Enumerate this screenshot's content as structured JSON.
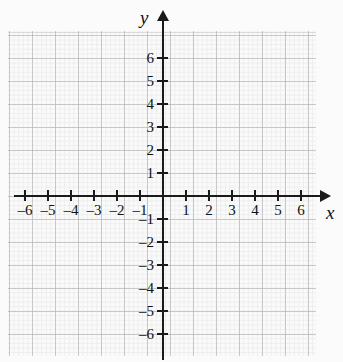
{
  "chart_data": {
    "type": "scatter",
    "title": "",
    "xlabel": "x",
    "ylabel": "y",
    "xlim": [
      -7,
      7
    ],
    "ylim": [
      -7,
      7
    ],
    "grid": true,
    "legend": false,
    "series": [],
    "x_ticks": [
      -6,
      -5,
      -4,
      -3,
      -2,
      -1,
      1,
      2,
      3,
      4,
      5,
      6
    ],
    "y_ticks": [
      6,
      5,
      4,
      3,
      2,
      1,
      -1,
      -2,
      -3,
      -4,
      -5,
      -6
    ],
    "x_tick_labels": [
      "–6",
      "–5",
      "–4",
      "–3",
      "–2",
      "–1",
      "1",
      "2",
      "3",
      "4",
      "5",
      "6"
    ],
    "y_tick_labels": [
      "6",
      "5",
      "4",
      "3",
      "2",
      "1",
      "–1",
      "–2",
      "–3",
      "–4",
      "–5",
      "–6"
    ],
    "origin_label": "",
    "unit_px": 23,
    "colors": {
      "axis": "#1a1a1a",
      "grid_major": "#d8d8d8",
      "grid_minor": "#ececec",
      "background": "#fafafa",
      "text": "#111111"
    }
  },
  "axes": {
    "x_name": "x",
    "y_name": "y"
  },
  "x_labels": [
    {
      "text": "–6",
      "value": -6
    },
    {
      "text": "–5",
      "value": -5
    },
    {
      "text": "–4",
      "value": -4
    },
    {
      "text": "–3",
      "value": -3
    },
    {
      "text": "–2",
      "value": -2
    },
    {
      "text": "–1",
      "value": -1
    },
    {
      "text": "1",
      "value": 1
    },
    {
      "text": "2",
      "value": 2
    },
    {
      "text": "3",
      "value": 3
    },
    {
      "text": "4",
      "value": 4
    },
    {
      "text": "5",
      "value": 5
    },
    {
      "text": "6",
      "value": 6
    }
  ],
  "y_labels": [
    {
      "text": "6",
      "value": 6
    },
    {
      "text": "5",
      "value": 5
    },
    {
      "text": "4",
      "value": 4
    },
    {
      "text": "3",
      "value": 3
    },
    {
      "text": "2",
      "value": 2
    },
    {
      "text": "1",
      "value": 1
    },
    {
      "text": "–1",
      "value": -1
    },
    {
      "text": "–2",
      "value": -2
    },
    {
      "text": "–3",
      "value": -3
    },
    {
      "text": "–4",
      "value": -4
    },
    {
      "text": "–5",
      "value": -5
    },
    {
      "text": "–6",
      "value": -6
    }
  ]
}
